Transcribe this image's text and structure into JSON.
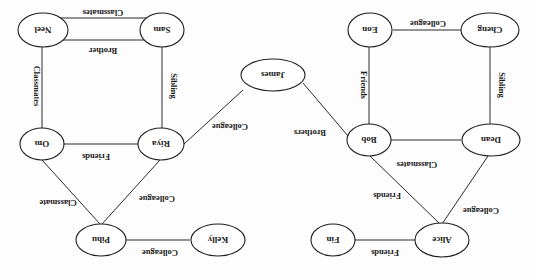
{
  "diagram": {
    "type": "relationship-graph",
    "orientation_note": "rendered rotated 180 degrees",
    "nodes": [
      {
        "id": "neel",
        "label": "Neel"
      },
      {
        "id": "sam",
        "label": "Sam"
      },
      {
        "id": "eon",
        "label": "Eon"
      },
      {
        "id": "cheng",
        "label": "Cheng"
      },
      {
        "id": "james",
        "label": "James"
      },
      {
        "id": "om",
        "label": "Om"
      },
      {
        "id": "riya",
        "label": "Riya"
      },
      {
        "id": "bob",
        "label": "Bob"
      },
      {
        "id": "dean",
        "label": "Dean"
      },
      {
        "id": "pihu",
        "label": "Pihu"
      },
      {
        "id": "kelly",
        "label": "Kelly"
      },
      {
        "id": "alice",
        "label": "Alice"
      },
      {
        "id": "fin",
        "label": "Fin"
      }
    ],
    "edges": [
      {
        "from": "neel",
        "to": "sam",
        "label": "Classmates"
      },
      {
        "from": "neel",
        "to": "sam",
        "label": "Brother"
      },
      {
        "from": "neel",
        "to": "om",
        "label": "Classmates"
      },
      {
        "from": "sam",
        "to": "riya",
        "label": "Sibling"
      },
      {
        "from": "om",
        "to": "riya",
        "label": "Friends"
      },
      {
        "from": "om",
        "to": "pihu",
        "label": "Classmate"
      },
      {
        "from": "riya",
        "to": "pihu",
        "label": "Colleague"
      },
      {
        "from": "riya",
        "to": "james",
        "label": "Colleague"
      },
      {
        "from": "pihu",
        "to": "kelly",
        "label": "Colleague"
      },
      {
        "from": "james",
        "to": "bob",
        "label": "Brothers"
      },
      {
        "from": "eon",
        "to": "cheng",
        "label": "Colleague"
      },
      {
        "from": "eon",
        "to": "bob",
        "label": "Friends"
      },
      {
        "from": "cheng",
        "to": "dean",
        "label": "Sibling"
      },
      {
        "from": "bob",
        "to": "dean",
        "label": ""
      },
      {
        "from": "bob",
        "to": "alice",
        "label": "Friends"
      },
      {
        "from": "dean",
        "to": "alice",
        "label": "Colleague"
      },
      {
        "from": "dean",
        "to": "bob",
        "label": "Classmates"
      },
      {
        "from": "alice",
        "to": "fin",
        "label": "Friends"
      }
    ]
  }
}
